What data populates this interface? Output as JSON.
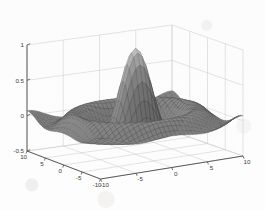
{
  "figure": {
    "kind": "matlab-3d-mesh-surface",
    "background_color": "#fdfdfd",
    "axis_line_color": "#4a4a4a",
    "grid_color": "#c9c9c9",
    "mesh_dark_color": "#2b2b2b",
    "mesh_light_color": "#d8d8d8"
  },
  "chart_data": {
    "type": "surface",
    "title": "",
    "subtitle": "",
    "xlabel": "",
    "ylabel": "",
    "zlabel": "",
    "function": "sinc: z = sin(r)/r, r = sqrt(x^2 + y^2)",
    "colormap": "gray",
    "shading": "mesh",
    "grid": true,
    "legend": null,
    "legend_position": null,
    "view": {
      "azimuth": -37.5,
      "elevation": 30
    },
    "xlim": [
      -10,
      10
    ],
    "ylim": [
      -10,
      10
    ],
    "zlim": [
      -0.5,
      1.0
    ],
    "x_ticks": [
      -10,
      -5,
      0,
      5,
      10
    ],
    "x_tick_labels": [
      "-10",
      "-5",
      "0",
      "5",
      "10"
    ],
    "y_ticks": [
      -10,
      -5,
      0,
      5,
      10
    ],
    "y_tick_labels": [
      "-10",
      "-5",
      "0",
      "5",
      "10"
    ],
    "z_ticks": [
      -0.5,
      0,
      0.5,
      1
    ],
    "z_tick_labels": [
      "-0.5",
      "0",
      "0.5",
      "1"
    ],
    "mesh_resolution": 34,
    "peak_value": 1.0,
    "peak_at": [
      0,
      0
    ],
    "first_trough_value": -0.217,
    "first_trough_radius": 4.49,
    "samples": {
      "r": [
        0,
        1,
        2,
        3,
        4,
        4.49,
        5,
        6,
        7,
        7.73,
        8,
        9,
        10,
        11,
        12,
        13,
        14
      ],
      "z": [
        1.0,
        0.841,
        0.455,
        0.047,
        -0.189,
        -0.217,
        -0.192,
        -0.047,
        0.094,
        0.128,
        0.124,
        0.046,
        -0.054,
        -0.091,
        -0.045,
        0.032,
        0.071
      ]
    }
  },
  "axes": {
    "z": {
      "name": "z-axis",
      "ticks": [
        {
          "value": 1,
          "label": "1"
        },
        {
          "value": 0.5,
          "label": "0.5"
        },
        {
          "value": 0,
          "label": "0"
        },
        {
          "value": -0.5,
          "label": "-0.5"
        }
      ]
    },
    "x_left_front": {
      "name": "x-axis",
      "ticks": [
        {
          "value": 10,
          "label": "10"
        },
        {
          "value": 5,
          "label": "5"
        },
        {
          "value": 0,
          "label": "0"
        },
        {
          "value": -5,
          "label": "-5"
        },
        {
          "value": -10,
          "label": "-10"
        }
      ]
    },
    "y_right_front": {
      "name": "y-axis",
      "ticks": [
        {
          "value": -10,
          "label": "-10"
        },
        {
          "value": -5,
          "label": "-5"
        },
        {
          "value": 0,
          "label": "0"
        },
        {
          "value": 5,
          "label": "5"
        },
        {
          "value": 10,
          "label": "10"
        }
      ]
    }
  }
}
